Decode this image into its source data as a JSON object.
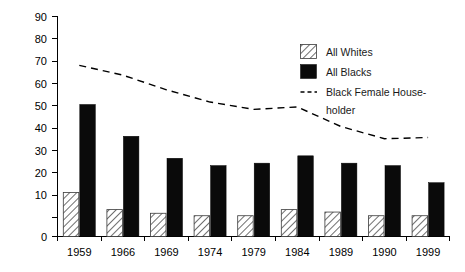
{
  "chart_data": {
    "type": "bar",
    "title": "",
    "subtitle": "",
    "xlabel": "",
    "ylabel": "",
    "categories": [
      "1959",
      "1966",
      "1969",
      "1974",
      "1979",
      "1984",
      "1989",
      "1990",
      "1999"
    ],
    "ylim": [
      0,
      90
    ],
    "yticks": [
      0,
      10,
      20,
      30,
      40,
      50,
      60,
      70,
      80,
      90
    ],
    "ytick_labels": [
      "0",
      "10",
      "20",
      "30",
      "40",
      "50",
      "60",
      "70",
      "80",
      "90"
    ],
    "grid": false,
    "legend_position": "upper-right",
    "series": [
      {
        "name": "All Whites",
        "type": "bar",
        "style": "hatched",
        "values": [
          18,
          11,
          9.5,
          8.5,
          8.5,
          11,
          10,
          8.5,
          8.5
        ]
      },
      {
        "name": "All Blacks",
        "type": "bar",
        "style": "solid-black",
        "values": [
          54,
          41,
          32,
          29,
          30,
          33,
          30,
          29,
          22
        ]
      },
      {
        "name": "Black Female House-holder",
        "type": "line",
        "style": "dashed",
        "values": [
          70,
          66,
          60,
          55,
          52,
          53,
          45,
          40,
          40.5
        ]
      }
    ]
  },
  "legend": {
    "entries": [
      {
        "label": "All Whites",
        "marker": "hatched-square"
      },
      {
        "label": "All Blacks",
        "marker": "black-square"
      },
      {
        "label": "Black Female House-",
        "marker": "dashed-line"
      },
      {
        "label": "holder",
        "marker": "none"
      }
    ]
  },
  "axes": {
    "y_labels": [
      "90",
      "80",
      "70",
      "60",
      "50",
      "40",
      "30",
      "20",
      "10",
      "0"
    ],
    "x_labels": [
      "1959",
      "1966",
      "1969",
      "1974",
      "1979",
      "1984",
      "1989",
      "1990",
      "1999"
    ]
  }
}
